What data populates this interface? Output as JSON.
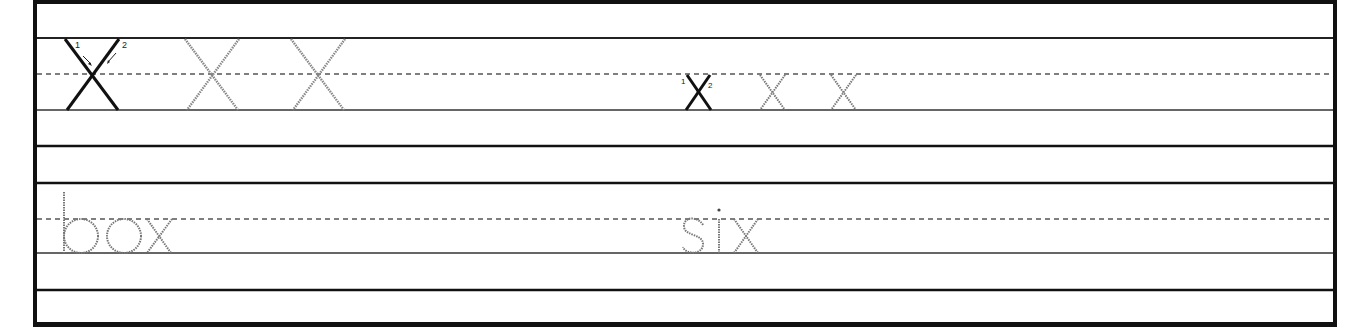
{
  "worksheet": {
    "row1": {
      "uppercase": {
        "letter": "X",
        "model_strokes": [
          {
            "order": "1",
            "direction": "down-right"
          },
          {
            "order": "2",
            "direction": "down-left"
          }
        ],
        "trace_count": 2
      },
      "lowercase": {
        "letter": "x",
        "model_strokes": [
          {
            "order": "1",
            "direction": "down-right"
          },
          {
            "order": "2",
            "direction": "down-left"
          }
        ],
        "trace_count": 2
      }
    },
    "row2": {
      "words": [
        "box",
        "six"
      ]
    },
    "colors": {
      "border": "#111111",
      "line": "#222222",
      "trace": "#8a8a8a",
      "model": "#111111"
    }
  }
}
